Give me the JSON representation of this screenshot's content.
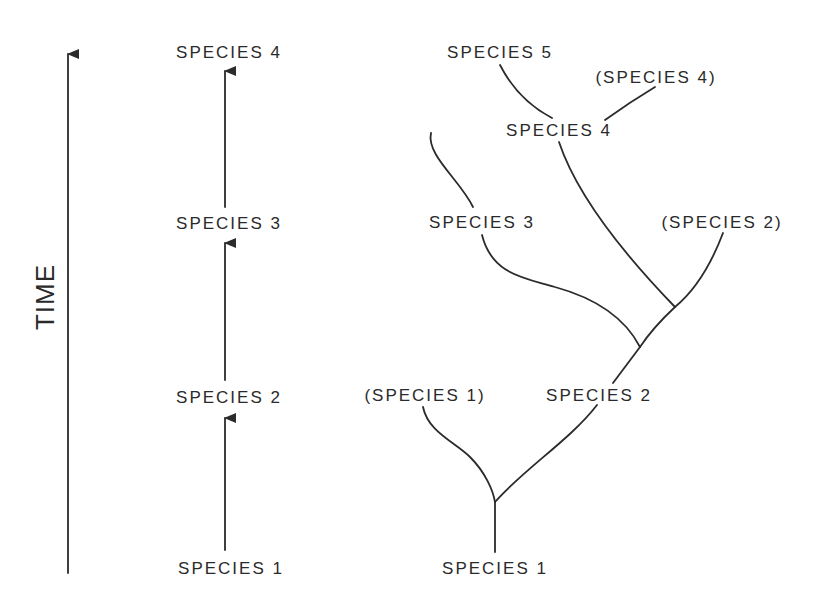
{
  "axis": {
    "label": "TIME"
  },
  "linear_model": {
    "labels": [
      "SPECIES 4",
      "SPECIES 3",
      "SPECIES 2",
      "SPECIES 1"
    ]
  },
  "branching_model": {
    "labels": {
      "species5": "SPECIES 5",
      "species4_ancestral": "(SPECIES 4)",
      "species4": "SPECIES 4",
      "species3": "SPECIES 3",
      "species2_ancestral": "(SPECIES 2)",
      "species1_ancestral": "(SPECIES 1)",
      "species2": "SPECIES 2",
      "species1": "SPECIES 1"
    }
  },
  "colors": {
    "ink": "#2b2b2b",
    "background": "#ffffff"
  }
}
